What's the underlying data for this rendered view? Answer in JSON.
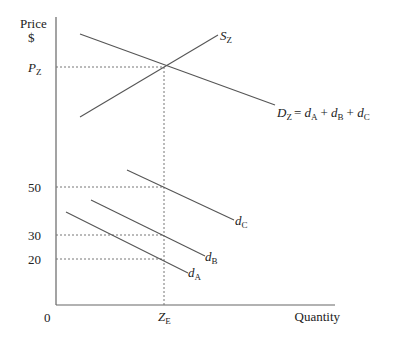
{
  "diagram": {
    "axes": {
      "y_label_line1": "Price",
      "y_label_line2": "$",
      "x_label": "Quantity",
      "origin": "0",
      "y_ticks": [
        {
          "label": "P",
          "sub": "Z",
          "y": 67,
          "italic": true
        },
        {
          "label": "50",
          "y": 187
        },
        {
          "label": "30",
          "y": 235
        },
        {
          "label": "20",
          "y": 259
        }
      ],
      "x_ticks": [
        {
          "label": "Z",
          "sub": "E",
          "x": 164
        }
      ]
    },
    "curves": {
      "supply": {
        "name": "S",
        "sub": "Z",
        "x1": 80,
        "y1": 117,
        "x2": 218,
        "y2": 35
      },
      "market_demand": {
        "name": "D",
        "sub": "Z",
        "equation": "= d",
        "sumA": "A",
        "sumB": "B",
        "sumC": "C",
        "x1": 80,
        "y1": 34,
        "x2": 275,
        "y2": 105
      },
      "dC": {
        "name": "d",
        "sub": "C",
        "x1": 127,
        "y1": 170,
        "x2": 234,
        "y2": 220
      },
      "dB": {
        "name": "d",
        "sub": "B",
        "x1": 91,
        "y1": 200,
        "x2": 205,
        "y2": 256
      },
      "dA": {
        "name": "d",
        "sub": "A",
        "x1": 66,
        "y1": 212,
        "x2": 188,
        "y2": 273
      }
    },
    "plus": "+",
    "colors": {
      "line": "#555555",
      "axis": "#666666",
      "text": "#222222"
    }
  }
}
